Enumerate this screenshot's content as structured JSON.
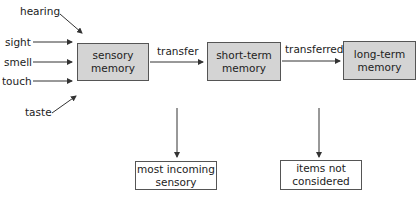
{
  "inputs": [
    {
      "label": "hearing"
    },
    {
      "label": "sight"
    },
    {
      "label": "smell"
    },
    {
      "label": "touch"
    },
    {
      "label": "taste"
    }
  ],
  "stages": [
    {
      "line1": "sensory",
      "line2": "memory"
    },
    {
      "line1": "short-term",
      "line2": "memory"
    },
    {
      "line1": "long-term",
      "line2": "memory"
    }
  ],
  "transitions": [
    {
      "label": "transfer"
    },
    {
      "label": "transferred"
    }
  ],
  "outcomes": [
    {
      "line1": "most incoming",
      "line2": "sensory"
    },
    {
      "line1": "items not",
      "line2": "considered"
    }
  ],
  "colors": {
    "stage_fill": "#d4d4d4",
    "border": "#555555",
    "arrow": "#333333"
  }
}
